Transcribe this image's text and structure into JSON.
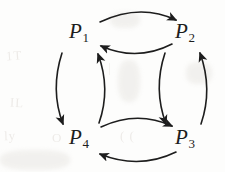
{
  "figure": {
    "type": "cycle-diagram",
    "ink_color": "#1d1d1d",
    "background_color": "#fdfdfc",
    "nodes": [
      {
        "id": "P1",
        "base": "P",
        "subscript": "1",
        "x": 79,
        "y": 33
      },
      {
        "id": "P2",
        "base": "P",
        "subscript": "2",
        "x": 185,
        "y": 33
      },
      {
        "id": "P3",
        "base": "P",
        "subscript": "3",
        "x": 185,
        "y": 139
      },
      {
        "id": "P4",
        "base": "P",
        "subscript": "4",
        "x": 79,
        "y": 139
      }
    ],
    "edges": [
      {
        "name": "p1-to-p2",
        "from": "P1",
        "to": "P2",
        "side": "top",
        "position": "outer",
        "bow": "up",
        "direction": "right"
      },
      {
        "name": "p2-to-p1",
        "from": "P2",
        "to": "P1",
        "side": "top",
        "position": "inner",
        "bow": "down",
        "direction": "left"
      },
      {
        "name": "p1-to-p4",
        "from": "P1",
        "to": "P4",
        "side": "left",
        "position": "outer",
        "bow": "left",
        "direction": "down"
      },
      {
        "name": "p4-to-p1",
        "from": "P4",
        "to": "P1",
        "side": "left",
        "position": "inner",
        "bow": "right",
        "direction": "up"
      },
      {
        "name": "p2-to-p3",
        "from": "P2",
        "to": "P3",
        "side": "right",
        "position": "inner",
        "bow": "left",
        "direction": "down"
      },
      {
        "name": "p3-to-p2",
        "from": "P3",
        "to": "P2",
        "side": "right",
        "position": "outer",
        "bow": "right",
        "direction": "up"
      },
      {
        "name": "p4-to-p3",
        "from": "P4",
        "to": "P3",
        "side": "bottom",
        "position": "inner",
        "bow": "up",
        "direction": "right"
      },
      {
        "name": "p3-to-p4",
        "from": "P3",
        "to": "P4",
        "side": "bottom",
        "position": "outer",
        "bow": "down",
        "direction": "left"
      }
    ]
  }
}
